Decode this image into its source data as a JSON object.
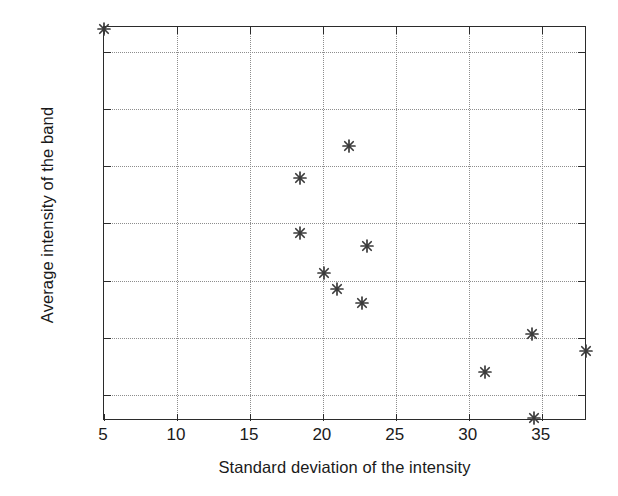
{
  "chart_data": {
    "type": "scatter",
    "title": "",
    "xlabel": "Standard deviation of the intensity",
    "ylabel": "Average intensity of the band",
    "xlim": [
      5,
      38.1
    ],
    "ylim": [
      177.7,
      212.2
    ],
    "xticks": [
      5,
      10,
      15,
      20,
      25,
      30,
      35
    ],
    "xticklabels": [
      "5",
      "10",
      "15",
      "20",
      "25",
      "30",
      "35"
    ],
    "yticks": [
      180,
      185,
      190,
      195,
      200,
      205,
      210
    ],
    "yticklabels": [
      "180",
      "185",
      "190",
      "195",
      "200",
      "205",
      "210"
    ],
    "grid": true,
    "grid_style": "dotted",
    "legend": null,
    "marker": "asterisk",
    "marker_color": "#3a3a3a",
    "axis_color": "#2b2b2b",
    "background": "#ffffff",
    "points": [
      {
        "x": 5.0,
        "y": 212.0
      },
      {
        "x": 18.4,
        "y": 199.0
      },
      {
        "x": 18.4,
        "y": 194.2
      },
      {
        "x": 20.1,
        "y": 190.7
      },
      {
        "x": 21.0,
        "y": 189.3
      },
      {
        "x": 21.8,
        "y": 201.8
      },
      {
        "x": 22.7,
        "y": 188.0
      },
      {
        "x": 23.0,
        "y": 193.0
      },
      {
        "x": 31.1,
        "y": 182.0
      },
      {
        "x": 34.3,
        "y": 185.3
      },
      {
        "x": 34.5,
        "y": 178.0
      },
      {
        "x": 38.0,
        "y": 183.8
      }
    ]
  }
}
